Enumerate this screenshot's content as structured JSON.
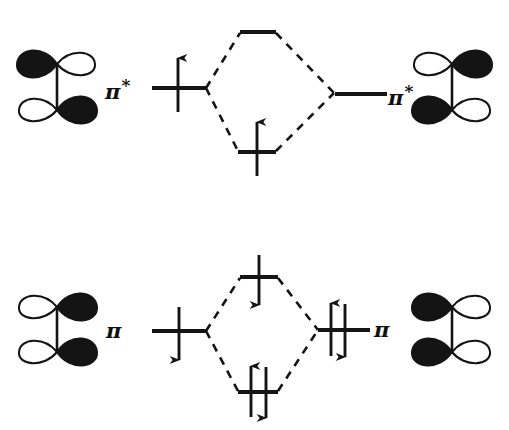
{
  "diagram": {
    "type": "mo-correlation-diagram",
    "ink_color": "#141414",
    "background_color": "#ffffff",
    "lobe_fill_color": "#141414",
    "lobe_empty_color": "#ffffff"
  },
  "labels": {
    "pi_star_left": "π",
    "pi_star_left_superscript": "*",
    "pi_star_right": "π",
    "pi_star_right_superscript": "*",
    "pi_left": "π",
    "pi_right": "π"
  },
  "upper_block": {
    "name": "pi-star-interaction",
    "left_fragment_level": {
      "label": "π*",
      "electrons": 1,
      "spins": [
        "up"
      ],
      "x": 152,
      "y": 88,
      "width": 54
    },
    "right_fragment_level": {
      "label": "π*",
      "electrons": 0,
      "spins": [],
      "x": 335,
      "y": 94,
      "width": 52
    },
    "center_upper_level": {
      "name": "antibonding-combination",
      "electrons": 0,
      "spins": [],
      "x": 240,
      "y": 32,
      "width": 36
    },
    "center_lower_level": {
      "name": "bonding-combination",
      "electrons": 1,
      "spins": [
        "up"
      ],
      "x": 238,
      "y": 152,
      "width": 38
    }
  },
  "lower_block": {
    "name": "pi-interaction",
    "left_fragment_level": {
      "label": "π",
      "electrons": 1,
      "spins": [
        "down"
      ],
      "x": 152,
      "y": 331,
      "width": 54
    },
    "right_fragment_level": {
      "label": "π",
      "electrons": 2,
      "spins": [
        "up",
        "down"
      ],
      "x": 318,
      "y": 330,
      "width": 52
    },
    "center_upper_level": {
      "name": "antibonding-combination",
      "electrons": 1,
      "spins": [
        "down"
      ],
      "x": 240,
      "y": 277,
      "width": 38
    },
    "center_lower_level": {
      "name": "bonding-combination",
      "electrons": 2,
      "spins": [
        "up",
        "down"
      ],
      "x": 238,
      "y": 392,
      "width": 40
    }
  },
  "orbitals": [
    {
      "name": "orbital-top-left",
      "position": "upper-left",
      "description": "p-pi antibonding fragment orbital",
      "top_lobe_filled_side": "left",
      "bottom_lobe_filled_side": "right"
    },
    {
      "name": "orbital-top-right",
      "position": "upper-right",
      "description": "p-pi antibonding fragment orbital",
      "top_lobe_filled_side": "right",
      "bottom_lobe_filled_side": "left"
    },
    {
      "name": "orbital-bottom-left",
      "position": "lower-left",
      "description": "p-pi bonding fragment orbital",
      "top_lobe_filled_side": "right",
      "bottom_lobe_filled_side": "right"
    },
    {
      "name": "orbital-bottom-right",
      "position": "lower-right",
      "description": "p-pi bonding fragment orbital",
      "top_lobe_filled_side": "left",
      "bottom_lobe_filled_side": "left"
    }
  ]
}
